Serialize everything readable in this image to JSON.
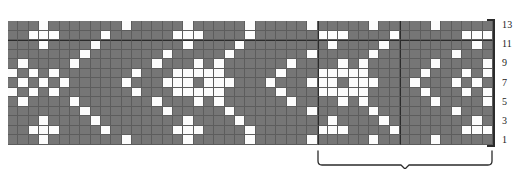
{
  "chart_data": {
    "type": "heatmap",
    "title": "",
    "xlabel": "",
    "ylabel": "",
    "subtitle": "",
    "grid_columns": 47,
    "grid_rows": 13,
    "legend": [
      {
        "name": "main-colour",
        "swatch": "#767676",
        "label": ""
      },
      {
        "name": "contrast-colour",
        "swatch": "#fcfcfc",
        "label": ""
      }
    ],
    "colors": {
      "main": "#767676",
      "contrast": "#fcfcfc",
      "gridline": "#5d5d5d",
      "major_line": "#2b2b2b",
      "text": "#1a1a1a",
      "background": "#ffffff"
    },
    "row_labels": [
      "13",
      "11",
      "9",
      "7",
      "5",
      "3",
      "1"
    ],
    "row_label_rows": [
      13,
      11,
      9,
      7,
      5,
      3,
      1
    ],
    "row_label_side": "right",
    "legend_position": "none",
    "grid": "on",
    "repeat": {
      "marked": true,
      "start_column": 31,
      "end_column": 47,
      "width_stitches": 17,
      "label": "",
      "major_vertical_lines_at_columns": [
        31,
        39
      ],
      "major_horizontal_line_after_row": 10
    },
    "cells_note": "matrix rows are listed top row first (row 13) down to row 1; 0 = main grey, 1 = contrast white",
    "matrix": [
      [
        0,
        0,
        0,
        1,
        0,
        0,
        0,
        0,
        0,
        0,
        0,
        1,
        0,
        0,
        0,
        0,
        0,
        1,
        0,
        0,
        0,
        0,
        0,
        1,
        0,
        0,
        0,
        0,
        0,
        1,
        0,
        0,
        0,
        0,
        0,
        1,
        0,
        0,
        0,
        0,
        0,
        1,
        0,
        0,
        0,
        0,
        0
      ],
      [
        0,
        0,
        1,
        1,
        1,
        0,
        0,
        0,
        0,
        1,
        0,
        0,
        0,
        0,
        0,
        0,
        1,
        1,
        1,
        0,
        0,
        0,
        0,
        1,
        0,
        0,
        0,
        0,
        0,
        0,
        1,
        1,
        1,
        0,
        0,
        0,
        0,
        1,
        0,
        0,
        0,
        0,
        0,
        0,
        1,
        1,
        1
      ],
      [
        0,
        0,
        0,
        1,
        0,
        0,
        0,
        0,
        1,
        0,
        0,
        0,
        0,
        0,
        0,
        0,
        0,
        1,
        0,
        0,
        0,
        0,
        1,
        0,
        0,
        0,
        0,
        0,
        0,
        0,
        0,
        1,
        0,
        0,
        0,
        0,
        1,
        0,
        0,
        0,
        0,
        0,
        0,
        0,
        0,
        1,
        0
      ],
      [
        0,
        0,
        0,
        0,
        0,
        0,
        0,
        1,
        0,
        0,
        0,
        0,
        0,
        0,
        0,
        1,
        0,
        0,
        0,
        0,
        0,
        1,
        0,
        0,
        0,
        0,
        0,
        0,
        0,
        1,
        0,
        0,
        0,
        0,
        0,
        1,
        0,
        0,
        0,
        0,
        0,
        0,
        0,
        1,
        0,
        0,
        0
      ],
      [
        0,
        1,
        0,
        0,
        0,
        0,
        1,
        0,
        0,
        0,
        0,
        0,
        0,
        0,
        1,
        0,
        0,
        0,
        1,
        0,
        1,
        0,
        0,
        0,
        0,
        0,
        0,
        1,
        0,
        0,
        0,
        0,
        1,
        0,
        1,
        0,
        0,
        0,
        0,
        0,
        0,
        1,
        0,
        0,
        0,
        0,
        1
      ],
      [
        1,
        0,
        1,
        0,
        1,
        0,
        0,
        0,
        0,
        0,
        0,
        0,
        1,
        0,
        0,
        0,
        1,
        1,
        1,
        1,
        1,
        0,
        0,
        0,
        0,
        0,
        1,
        0,
        0,
        0,
        1,
        1,
        1,
        1,
        1,
        0,
        0,
        0,
        0,
        0,
        1,
        0,
        0,
        0,
        1,
        0,
        1
      ],
      [
        0,
        1,
        0,
        1,
        0,
        1,
        0,
        0,
        0,
        0,
        0,
        1,
        0,
        0,
        0,
        1,
        1,
        1,
        0,
        1,
        1,
        1,
        0,
        0,
        0,
        1,
        0,
        0,
        0,
        1,
        1,
        1,
        0,
        1,
        1,
        1,
        0,
        0,
        0,
        1,
        0,
        0,
        0,
        1,
        0,
        1,
        0
      ],
      [
        1,
        0,
        1,
        0,
        1,
        0,
        0,
        0,
        0,
        0,
        0,
        0,
        1,
        0,
        0,
        0,
        1,
        1,
        1,
        1,
        1,
        0,
        0,
        0,
        0,
        0,
        1,
        0,
        0,
        0,
        1,
        1,
        1,
        1,
        1,
        0,
        0,
        0,
        0,
        0,
        1,
        0,
        0,
        0,
        1,
        0,
        1
      ],
      [
        0,
        1,
        0,
        0,
        0,
        0,
        1,
        0,
        0,
        0,
        0,
        0,
        0,
        0,
        1,
        0,
        0,
        0,
        1,
        0,
        1,
        0,
        0,
        0,
        0,
        0,
        0,
        1,
        0,
        0,
        0,
        0,
        1,
        0,
        1,
        0,
        0,
        0,
        0,
        0,
        0,
        1,
        0,
        0,
        0,
        0,
        1
      ],
      [
        0,
        0,
        0,
        0,
        0,
        0,
        0,
        1,
        0,
        0,
        0,
        0,
        0,
        0,
        0,
        1,
        0,
        0,
        0,
        0,
        0,
        1,
        0,
        0,
        0,
        0,
        0,
        0,
        0,
        1,
        0,
        0,
        0,
        0,
        0,
        1,
        0,
        0,
        0,
        0,
        0,
        0,
        0,
        1,
        0,
        0,
        0
      ],
      [
        0,
        0,
        0,
        1,
        0,
        0,
        0,
        0,
        1,
        0,
        0,
        0,
        0,
        0,
        0,
        0,
        0,
        1,
        0,
        0,
        0,
        0,
        1,
        0,
        0,
        0,
        0,
        0,
        0,
        0,
        0,
        1,
        0,
        0,
        0,
        0,
        1,
        0,
        0,
        0,
        0,
        0,
        0,
        0,
        0,
        1,
        0
      ],
      [
        0,
        0,
        1,
        1,
        1,
        0,
        0,
        0,
        0,
        1,
        0,
        0,
        0,
        0,
        0,
        0,
        1,
        1,
        1,
        0,
        0,
        0,
        0,
        1,
        0,
        0,
        0,
        0,
        0,
        0,
        1,
        1,
        1,
        0,
        0,
        0,
        0,
        1,
        0,
        0,
        0,
        0,
        0,
        0,
        1,
        1,
        1
      ],
      [
        0,
        0,
        0,
        1,
        0,
        0,
        0,
        0,
        0,
        0,
        0,
        1,
        0,
        0,
        0,
        0,
        0,
        1,
        0,
        0,
        0,
        0,
        0,
        1,
        0,
        0,
        0,
        0,
        0,
        1,
        0,
        0,
        0,
        0,
        0,
        1,
        0,
        0,
        0,
        0,
        0,
        1,
        0,
        0,
        0,
        0,
        0
      ]
    ]
  }
}
